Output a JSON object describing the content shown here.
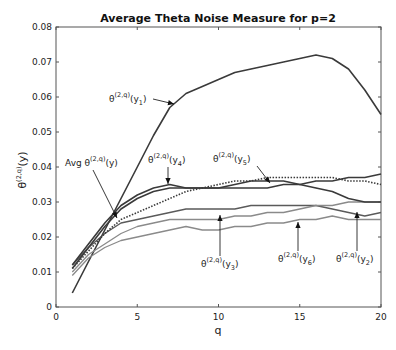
{
  "chart_data": {
    "type": "line",
    "title": "Average Theta Noise Measure for p=2",
    "xlabel": "q",
    "ylabel": "θ^(2,q)(y)",
    "xlim": [
      0,
      20
    ],
    "ylim": [
      0,
      0.08
    ],
    "xticks": [
      "0",
      "5",
      "10",
      "15",
      "20"
    ],
    "yticks": [
      "0",
      "0.01",
      "0.02",
      "0.03",
      "0.04",
      "0.05",
      "0.06",
      "0.07",
      "0.08"
    ],
    "grid": false,
    "legend": "none (inline arrow annotations)",
    "x": [
      1,
      2,
      3,
      4,
      5,
      6,
      7,
      8,
      9,
      10,
      11,
      12,
      13,
      14,
      15,
      16,
      17,
      18,
      19,
      20
    ],
    "series": [
      {
        "name": "θ(2,q)(y1)",
        "style": "solid-dark",
        "values": [
          0.004,
          0.013,
          0.022,
          0.031,
          0.04,
          0.049,
          0.057,
          0.061,
          0.063,
          0.065,
          0.067,
          0.068,
          0.069,
          0.07,
          0.071,
          0.072,
          0.071,
          0.068,
          0.062,
          0.055
        ]
      },
      {
        "name": "θ(2,q)(y2)",
        "style": "solid-mid",
        "values": [
          0.012,
          0.017,
          0.021,
          0.024,
          0.025,
          0.026,
          0.027,
          0.028,
          0.028,
          0.028,
          0.028,
          0.029,
          0.029,
          0.029,
          0.029,
          0.029,
          0.028,
          0.027,
          0.026,
          0.027
        ]
      },
      {
        "name": "θ(2,q)(y3)",
        "style": "solid-light",
        "values": [
          0.01,
          0.015,
          0.018,
          0.021,
          0.023,
          0.024,
          0.025,
          0.025,
          0.025,
          0.025,
          0.026,
          0.026,
          0.027,
          0.027,
          0.028,
          0.029,
          0.029,
          0.03,
          0.03,
          0.03
        ]
      },
      {
        "name": "θ(2,q)(y4)",
        "style": "solid-dark",
        "values": [
          0.012,
          0.018,
          0.024,
          0.029,
          0.032,
          0.034,
          0.035,
          0.034,
          0.034,
          0.034,
          0.034,
          0.034,
          0.034,
          0.035,
          0.035,
          0.036,
          0.036,
          0.037,
          0.037,
          0.038
        ]
      },
      {
        "name": "θ(2,q)(y5)",
        "style": "solid-dark",
        "values": [
          0.011,
          0.017,
          0.023,
          0.028,
          0.031,
          0.033,
          0.034,
          0.034,
          0.034,
          0.034,
          0.035,
          0.036,
          0.036,
          0.036,
          0.035,
          0.034,
          0.033,
          0.031,
          0.03,
          0.03
        ]
      },
      {
        "name": "θ(2,q)(y6)",
        "style": "solid-light",
        "values": [
          0.009,
          0.014,
          0.017,
          0.019,
          0.02,
          0.021,
          0.022,
          0.023,
          0.022,
          0.022,
          0.023,
          0.023,
          0.024,
          0.024,
          0.025,
          0.025,
          0.026,
          0.025,
          0.025,
          0.025
        ]
      },
      {
        "name": "Avg θ(2,q)(y)",
        "style": "dotted",
        "values": [
          0.011,
          0.016,
          0.021,
          0.025,
          0.027,
          0.029,
          0.031,
          0.033,
          0.034,
          0.035,
          0.036,
          0.036,
          0.037,
          0.037,
          0.037,
          0.037,
          0.037,
          0.036,
          0.036,
          0.035
        ]
      }
    ],
    "annotations": [
      {
        "label": "θ(2,q)(y1)",
        "target_series": "θ(2,q)(y1)"
      },
      {
        "label": "Avg θ(2,q)(y)",
        "target_series": "Avg θ(2,q)(y)"
      },
      {
        "label": "θ(2,q)(y4)",
        "target_series": "θ(2,q)(y4)"
      },
      {
        "label": "θ(2,q)(y5)",
        "target_series": "θ(2,q)(y5)"
      },
      {
        "label": "θ(2,q)(y3)",
        "target_series": "θ(2,q)(y3)"
      },
      {
        "label": "θ(2,q)(y6)",
        "target_series": "θ(2,q)(y6)"
      },
      {
        "label": "θ(2,q)(y2)",
        "target_series": "θ(2,q)(y2)"
      }
    ]
  },
  "labels": {
    "title": "Average Theta Noise Measure for p=2",
    "xlabel": "q",
    "ylabel_base": "θ",
    "ylabel_sup": "(2,q)",
    "ylabel_arg": "(y)",
    "ann_theta": "θ",
    "ann_sup": "(2,q)",
    "ann_avg_prefix": "Avg ",
    "ann_y": "(y)",
    "ann_y1": "(y",
    "sub_1": "1",
    "sub_2": "2",
    "sub_3": "3",
    "sub_4": "4",
    "sub_5": "5",
    "sub_6": "6",
    "close": ")"
  },
  "colors": {
    "dark": "#3a3a3a",
    "mid": "#5a5a5a",
    "light": "#8a8a8a",
    "axis": "#555555"
  }
}
